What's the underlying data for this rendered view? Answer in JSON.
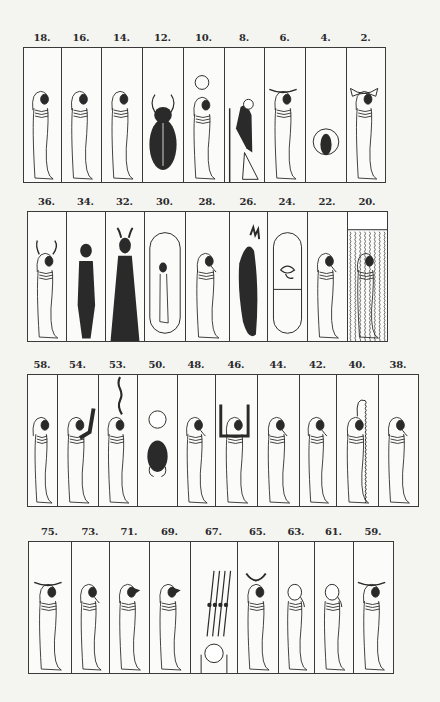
{
  "plate": {
    "background": "#f4f4f1",
    "ink": "#2a2a2a",
    "rows": [
      {
        "top": 47,
        "bottom": 183,
        "label_y": 32,
        "edges": [
          23,
          61,
          101,
          142,
          183,
          224,
          264,
          305,
          346,
          385
        ],
        "panels": [
          {
            "label": "18.",
            "figure": "mummy-human"
          },
          {
            "label": "16.",
            "figure": "mummy-human"
          },
          {
            "label": "14.",
            "figure": "mummy-human"
          },
          {
            "label": "12.",
            "figure": "scarab-large"
          },
          {
            "label": "10.",
            "figure": "mummy-sun-disk"
          },
          {
            "label": "8.",
            "figure": "kneeling-dark-figure"
          },
          {
            "label": "6.",
            "figure": "mummy-ram-horns"
          },
          {
            "label": "4.",
            "figure": "scarab-in-circle"
          },
          {
            "label": "2.",
            "figure": "mummy-winged"
          }
        ]
      },
      {
        "top": 211,
        "bottom": 342,
        "label_y": 196,
        "edges": [
          27,
          66,
          105,
          144,
          185,
          229,
          267,
          307,
          347,
          387
        ],
        "panels": [
          {
            "label": "36.",
            "figure": "mummy-long-horns"
          },
          {
            "label": "34.",
            "figure": "standing-dark-figure"
          },
          {
            "label": "32.",
            "figure": "standing-dark-robed-horned"
          },
          {
            "label": "30.",
            "figure": "small-mummy-in-cartouche"
          },
          {
            "label": "28.",
            "figure": "mummy-beard"
          },
          {
            "label": "26.",
            "figure": "dark-animal-upright"
          },
          {
            "label": "24.",
            "figure": "eye-in-cartouche"
          },
          {
            "label": "22.",
            "figure": "mummy-beard"
          },
          {
            "label": "20.",
            "figure": "mummy-in-water"
          }
        ]
      },
      {
        "top": 374,
        "bottom": 507,
        "label_y": 359,
        "edges": [
          27,
          57,
          98,
          137,
          177,
          215,
          257,
          299,
          336,
          378,
          418
        ],
        "panels": [
          {
            "label": "58.",
            "figure": "mummy-hawk"
          },
          {
            "label": "54.",
            "figure": "mummy-raised-arm"
          },
          {
            "label": "53.",
            "figure": "mummy-serpent-above"
          },
          {
            "label": "50.",
            "figure": "scarab-with-disk"
          },
          {
            "label": "48.",
            "figure": "mummy-beard"
          },
          {
            "label": "46.",
            "figure": "mummy-both-arms-raised"
          },
          {
            "label": "44.",
            "figure": "mummy-beard"
          },
          {
            "label": "42.",
            "figure": "mummy-beard"
          },
          {
            "label": "40.",
            "figure": "mummy-serpent-wavy"
          },
          {
            "label": "38.",
            "figure": "mummy-beard"
          }
        ]
      },
      {
        "top": 541,
        "bottom": 674,
        "label_y": 526,
        "edges": [
          28,
          71,
          109,
          149,
          190,
          237,
          278,
          314,
          353,
          393
        ],
        "panels": [
          {
            "label": "75.",
            "figure": "mummy-ram-horns"
          },
          {
            "label": "73.",
            "figure": "mummy-beard"
          },
          {
            "label": "71.",
            "figure": "mummy-jackal"
          },
          {
            "label": "69.",
            "figure": "mummy-jackal"
          },
          {
            "label": "67.",
            "figure": "disk-with-plumes"
          },
          {
            "label": "65.",
            "figure": "mummy-crescent"
          },
          {
            "label": "63.",
            "figure": "mummy-bald"
          },
          {
            "label": "61.",
            "figure": "mummy-bald"
          },
          {
            "label": "59.",
            "figure": "mummy-ram-horns"
          }
        ]
      }
    ]
  }
}
